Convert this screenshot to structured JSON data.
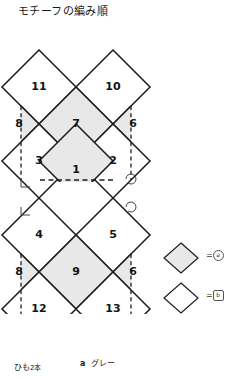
{
  "title": "モチーフの編み順",
  "diagram": {
    "fill_shaded": "#e8e8e8",
    "fill_plain": "#ffffff",
    "stroke": "#1c1c1c",
    "dash_stroke": "#1c1c1c",
    "cells": [
      {
        "n": "11",
        "cx": 39,
        "cy": 65,
        "shaded": false,
        "clip": "none"
      },
      {
        "n": "10",
        "cx": 113,
        "cy": 65,
        "shaded": false,
        "clip": "none"
      },
      {
        "n": "8",
        "cx": 2,
        "cy": 102,
        "shaded": true,
        "clip": "left"
      },
      {
        "n": "7",
        "cx": 76,
        "cy": 102,
        "shaded": true,
        "clip": "none"
      },
      {
        "n": "6",
        "cx": 150,
        "cy": 102,
        "shaded": true,
        "clip": "right"
      },
      {
        "n": "3",
        "cx": 39,
        "cy": 139,
        "shaded": false,
        "clip": "none"
      },
      {
        "n": "2",
        "cx": 113,
        "cy": 139,
        "shaded": false,
        "clip": "none"
      },
      {
        "n": "1",
        "cx": 76,
        "cy": 139,
        "shaded": true,
        "clip": "bottom"
      },
      {
        "n": "4",
        "cx": 39,
        "cy": 213,
        "shaded": false,
        "clip": "none"
      },
      {
        "n": "5",
        "cx": 113,
        "cy": 213,
        "shaded": false,
        "clip": "none"
      },
      {
        "n": "8",
        "cx": 2,
        "cy": 250,
        "shaded": true,
        "clip": "left"
      },
      {
        "n": "9",
        "cx": 76,
        "cy": 250,
        "shaded": true,
        "clip": "none"
      },
      {
        "n": "6",
        "cx": 150,
        "cy": 250,
        "shaded": true,
        "clip": "right"
      },
      {
        "n": "12",
        "cx": 39,
        "cy": 287,
        "shaded": false,
        "clip": "none"
      },
      {
        "n": "13",
        "cx": 113,
        "cy": 287,
        "shaded": false,
        "clip": "none"
      }
    ],
    "markers": {
      "left_corner_squares": [
        {
          "x": 21,
          "y": 157
        },
        {
          "x": 21,
          "y": 185
        }
      ],
      "right_corner_arcs": [
        {
          "x": 131,
          "y": 157
        },
        {
          "x": 131,
          "y": 185
        }
      ]
    }
  },
  "legend": {
    "rows": [
      {
        "swatch": "shaded-diamond",
        "equals": "=",
        "mark": "a",
        "mark_shape": "circle"
      },
      {
        "swatch": "plain-diamond",
        "equals": "=",
        "mark": "b",
        "mark_shape": "square"
      }
    ]
  },
  "footer": {
    "yarn_label": "ひも",
    "yarn_count": "2本",
    "color_key": "a",
    "color_name": "グレー"
  }
}
